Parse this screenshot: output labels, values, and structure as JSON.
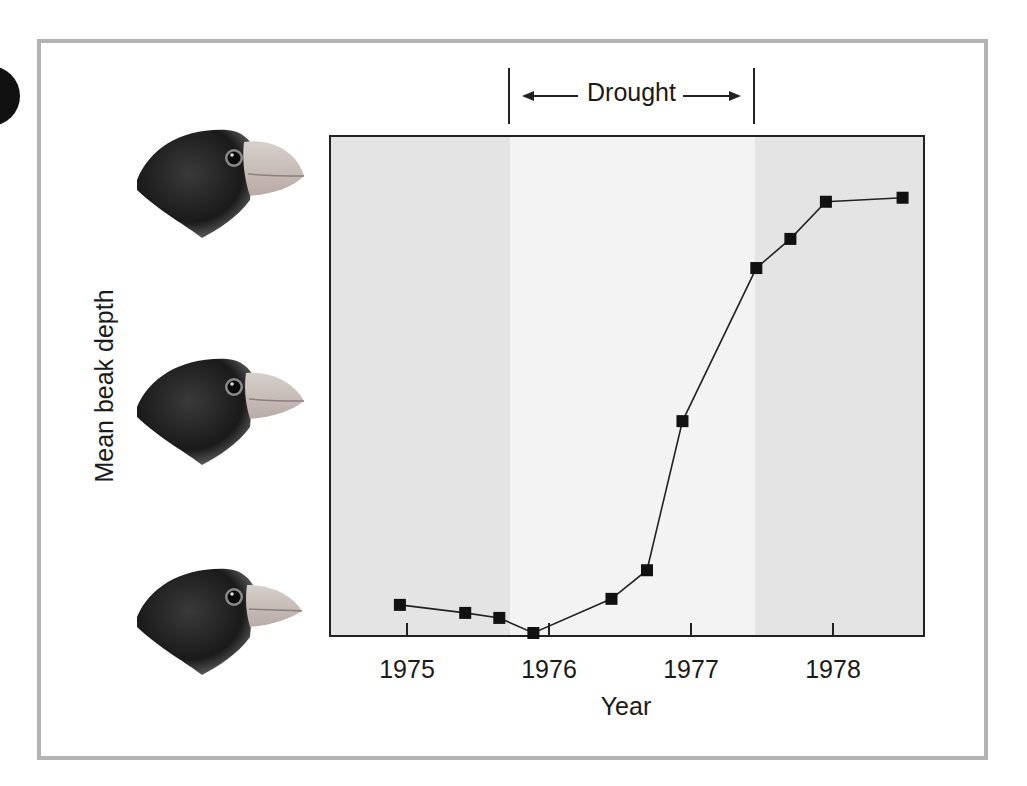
{
  "figure": {
    "xlabel": "Year",
    "ylabel": "Mean beak depth",
    "period_label": "Drought",
    "period_arrows": {
      "left": "left-arrow",
      "right": "right-arrow"
    },
    "icons": [
      "finch-head-icon",
      "finch-head-icon",
      "finch-head-icon"
    ],
    "colors": {
      "frame_border": "#b3b3b3",
      "shade_outside_drought": "#e4e4e4",
      "shade_drought": "#f3f3f3",
      "line": "#222222",
      "marker": "#111111"
    }
  },
  "chart_data": {
    "type": "line",
    "title": "",
    "xlabel": "Year",
    "ylabel": "Mean beak depth",
    "x_ticks": [
      1975,
      1976,
      1977,
      1978
    ],
    "xlim": [
      1974.55,
      1978.75
    ],
    "ylim": [
      0,
      10
    ],
    "y_units": "relative (no numeric ticks shown)",
    "grid": false,
    "legend": null,
    "shaded_regions": [
      {
        "label": "Drought",
        "x_start": 1975.71,
        "x_end": 1977.44,
        "shade": "light"
      },
      {
        "label": "",
        "x_start": 1974.55,
        "x_end": 1975.71,
        "shade": "dark"
      },
      {
        "label": "",
        "x_start": 1977.44,
        "x_end": 1978.75,
        "shade": "dark"
      }
    ],
    "series": [
      {
        "name": "Mean beak depth",
        "marker": "square",
        "x": [
          1974.95,
          1975.41,
          1975.65,
          1975.89,
          1976.44,
          1976.69,
          1976.94,
          1977.46,
          1977.7,
          1977.95,
          1978.49
        ],
        "values": [
          0.64,
          0.48,
          0.38,
          0.08,
          0.76,
          1.33,
          4.3,
          7.35,
          7.93,
          8.67,
          8.75
        ]
      }
    ]
  }
}
